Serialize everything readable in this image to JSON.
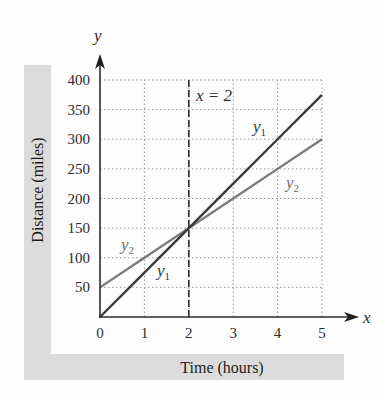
{
  "chart_data": {
    "type": "line",
    "title": "",
    "xlabel": "Time (hours)",
    "ylabel": "Distance (miles)",
    "x_axis_var": "x",
    "y_axis_var": "y",
    "xlim": [
      0,
      5
    ],
    "ylim": [
      0,
      400
    ],
    "x_ticks": [
      "0",
      "1",
      "2",
      "3",
      "4",
      "5"
    ],
    "y_ticks": [
      "50",
      "100",
      "150",
      "200",
      "250",
      "300",
      "350",
      "400"
    ],
    "grid": true,
    "grid_style": "dotted",
    "legend": "inline labels",
    "series": [
      {
        "name": "y1",
        "x": [
          0,
          1,
          2,
          3,
          4,
          5
        ],
        "values": [
          0,
          75,
          150,
          225,
          300,
          375
        ],
        "color": "#3a3a3a"
      },
      {
        "name": "y2",
        "x": [
          0,
          1,
          2,
          3,
          4,
          5
        ],
        "values": [
          50,
          100,
          150,
          200,
          250,
          300
        ],
        "color": "#7a7a7a"
      }
    ],
    "annotations": [
      {
        "text": "x = 2",
        "type": "vertical dashed line",
        "x": 2
      }
    ],
    "intersection": {
      "x": 2,
      "y": 150
    }
  },
  "labels": {
    "y_var": "y",
    "x_var": "x",
    "vline": "x = 2",
    "y1_main": "y",
    "y1_sub": "1",
    "y2_main": "y",
    "y2_sub": "2",
    "xlabel": "Time (hours)",
    "ylabel": "Distance (miles)"
  }
}
